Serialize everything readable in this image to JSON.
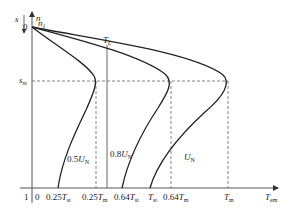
{
  "figure": {
    "type": "torque-slip characteristic diagram",
    "axes": {
      "vertical_label_s": "s",
      "vertical_label_n": "n",
      "horizontal_label": "T",
      "horizontal_label_sub": "em",
      "origin_zero_label": "0",
      "s_one_label": "1",
      "n1_label": "n",
      "n1_sub": "1",
      "sm_label": "s",
      "sm_sub": "m"
    },
    "load_line": {
      "label": "T",
      "sub": "L"
    },
    "curves": [
      {
        "name": "0.5UN",
        "label_prefix": "0.5",
        "label_main": "U",
        "label_sub": "N"
      },
      {
        "name": "0.8UN",
        "label_prefix": "0.8",
        "label_main": "U",
        "label_sub": "N"
      },
      {
        "name": "UN",
        "label_prefix": "",
        "label_main": "U",
        "label_sub": "N"
      }
    ],
    "x_ticks": [
      {
        "prefix": "0.25",
        "main": "T",
        "sub": "st"
      },
      {
        "prefix": "0.25",
        "main": "T",
        "sub": "m"
      },
      {
        "prefix": "0.64",
        "main": "T",
        "sub": "st"
      },
      {
        "prefix": "",
        "main": "T",
        "sub": "st"
      },
      {
        "prefix": "0.64",
        "main": "T",
        "sub": "m"
      },
      {
        "prefix": "",
        "main": "T",
        "sub": "m"
      }
    ]
  }
}
